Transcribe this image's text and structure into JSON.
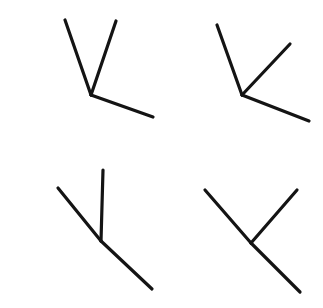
{
  "canvas": {
    "width": 323,
    "height": 308,
    "background_color": "#ffffff",
    "description": "Line drawing sheet with four three-segment vertex figures arranged in a 2x2 grid"
  },
  "style": {
    "stroke_color": "#141414",
    "stroke_width": 3.2,
    "stroke_linecap": "round"
  },
  "chart_data": {
    "type": "diagram",
    "title": "",
    "xlabel": "",
    "ylabel": "",
    "xlim": [
      0,
      323
    ],
    "ylim": [
      0,
      308
    ],
    "grid": false,
    "legend": "none",
    "figures": [
      {
        "id": "figure-top-left",
        "label": "top-left",
        "vertex": {
          "x": 91,
          "y": 95
        },
        "segments": [
          {
            "name": "upper-left-arm",
            "x1": 91,
            "y1": 95,
            "x2": 65,
            "y2": 20
          },
          {
            "name": "upper-right-arm",
            "x1": 91,
            "y1": 95,
            "x2": 116,
            "y2": 21
          },
          {
            "name": "lower-right-arm",
            "x1": 91,
            "y1": 95,
            "x2": 153,
            "y2": 117
          }
        ]
      },
      {
        "id": "figure-top-right",
        "label": "top-right",
        "vertex": {
          "x": 242,
          "y": 95
        },
        "segments": [
          {
            "name": "upper-left-arm",
            "x1": 242,
            "y1": 95,
            "x2": 217,
            "y2": 25
          },
          {
            "name": "upper-right-arm",
            "x1": 242,
            "y1": 95,
            "x2": 290,
            "y2": 44
          },
          {
            "name": "lower-right-arm",
            "x1": 242,
            "y1": 95,
            "x2": 309,
            "y2": 121
          }
        ]
      },
      {
        "id": "figure-bottom-left",
        "label": "bottom-left",
        "vertex": {
          "x": 101,
          "y": 241
        },
        "segments": [
          {
            "name": "upper-left-arm",
            "x1": 101,
            "y1": 241,
            "x2": 58,
            "y2": 188
          },
          {
            "name": "vertical-arm",
            "x1": 101,
            "y1": 241,
            "x2": 103,
            "y2": 170
          },
          {
            "name": "lower-right-arm",
            "x1": 101,
            "y1": 241,
            "x2": 152,
            "y2": 289
          }
        ]
      },
      {
        "id": "figure-bottom-right",
        "label": "bottom-right",
        "vertex": {
          "x": 251,
          "y": 243
        },
        "segments": [
          {
            "name": "upper-left-arm",
            "x1": 251,
            "y1": 243,
            "x2": 205,
            "y2": 190
          },
          {
            "name": "upper-right-arm",
            "x1": 251,
            "y1": 243,
            "x2": 297,
            "y2": 190
          },
          {
            "name": "lower-right-arm",
            "x1": 251,
            "y1": 243,
            "x2": 300,
            "y2": 292
          }
        ]
      }
    ]
  }
}
